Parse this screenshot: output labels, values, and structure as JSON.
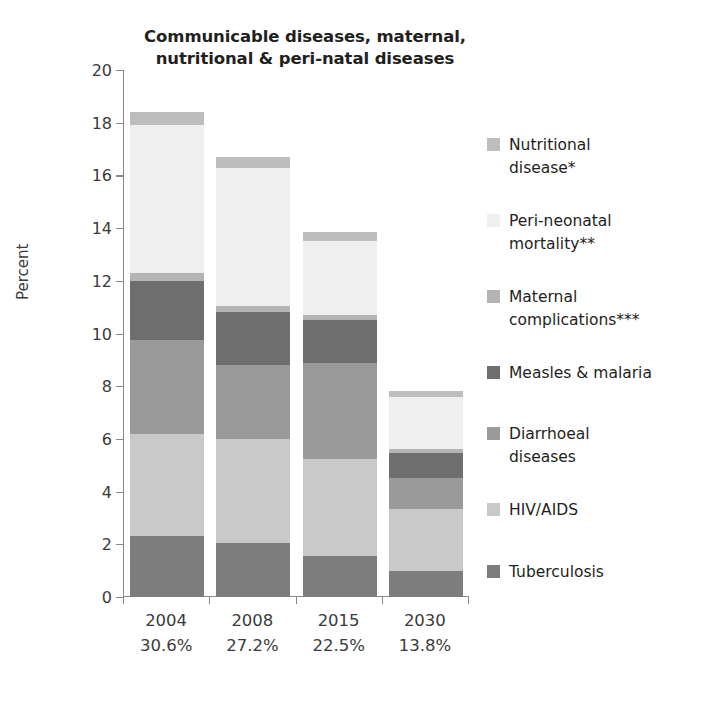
{
  "chart_data": {
    "type": "bar",
    "subtype": "stacked-vertical",
    "title": "Communicable diseases, maternal, nutritional & peri-natal diseases",
    "xlabel": "",
    "ylabel": "Percent",
    "ylim": [
      0,
      20
    ],
    "ytick_step": 2,
    "yticks": [
      0,
      2,
      4,
      6,
      8,
      10,
      12,
      14,
      16,
      18,
      20
    ],
    "grid": false,
    "legend_position": "right",
    "categories": [
      "2004",
      "2008",
      "2015",
      "2030"
    ],
    "category_sublabels": [
      "30.6%",
      "27.2%",
      "22.5%",
      "13.8%"
    ],
    "stack_order_bottom_to_top": [
      "Tuberculosis",
      "HIV/AIDS",
      "Diarrhoeal diseases",
      "Measles & malaria",
      "Maternal complications***",
      "Peri-neonatal mortality**",
      "Nutritional disease*"
    ],
    "series": [
      {
        "name": "Tuberculosis",
        "color": "#7d7d7d",
        "values": [
          2.3,
          2.05,
          1.55,
          1.0
        ]
      },
      {
        "name": "HIV/AIDS",
        "color": "#c9c9c9",
        "values": [
          3.9,
          3.95,
          3.7,
          2.35
        ]
      },
      {
        "name": "Diarrhoeal diseases",
        "color": "#9a9a9a",
        "values": [
          3.55,
          2.8,
          3.65,
          1.15
        ]
      },
      {
        "name": "Measles & malaria",
        "color": "#6e6e6e",
        "values": [
          2.25,
          2.0,
          1.6,
          0.95
        ]
      },
      {
        "name": "Maternal complications***",
        "color": "#b4b4b4",
        "values": [
          0.3,
          0.25,
          0.2,
          0.15
        ]
      },
      {
        "name": "Peri-neonatal mortality**",
        "color": "#efefef",
        "values": [
          5.6,
          5.25,
          2.8,
          2.0
        ]
      },
      {
        "name": "Nutritional disease*",
        "color": "#bdbdbd",
        "values": [
          0.5,
          0.4,
          0.35,
          0.2
        ]
      }
    ],
    "totals": [
      18.4,
      16.7,
      13.85,
      7.8
    ]
  },
  "legend": {
    "items": [
      {
        "label": "Nutritional\ndisease*",
        "color": "#bdbdbd",
        "top": 0
      },
      {
        "label": "Peri-neonatal\nmortality**",
        "color": "#efefef",
        "top": 76
      },
      {
        "label": "Maternal\ncomplications***",
        "color": "#b4b4b4",
        "top": 152
      },
      {
        "label": "Measles & malaria",
        "color": "#6e6e6e",
        "top": 228
      },
      {
        "label": "Diarrhoeal\ndiseases",
        "color": "#9a9a9a",
        "top": 289
      },
      {
        "label": "HIV/AIDS",
        "color": "#c9c9c9",
        "top": 365
      },
      {
        "label": "Tuberculosis",
        "color": "#7d7d7d",
        "top": 427
      }
    ]
  },
  "axis": {
    "y_title": "Percent"
  },
  "colors": {
    "axis": "#8a8a8a",
    "text": "#231f20",
    "tick_text": "#3b3b3b",
    "background": "#ffffff"
  }
}
